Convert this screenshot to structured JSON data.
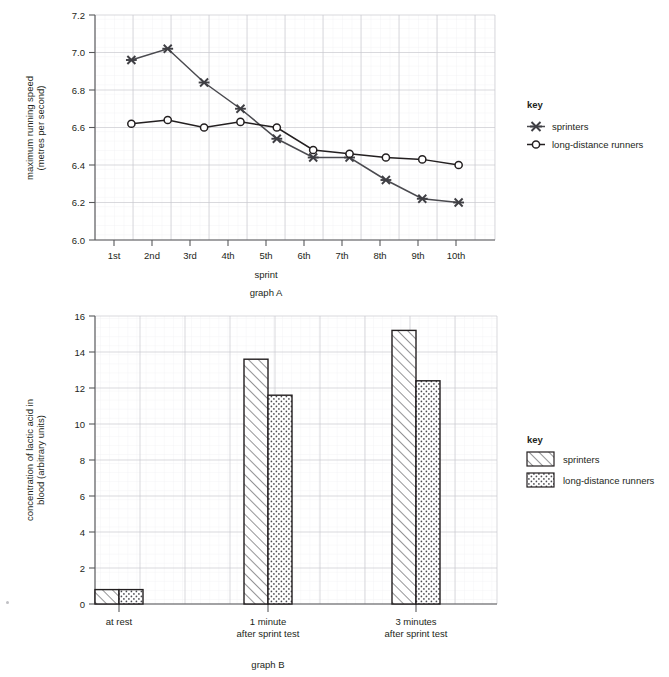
{
  "chart_data": [
    {
      "id": "graphA",
      "type": "line",
      "caption": "graph A",
      "title": "",
      "xlabel": "sprint",
      "ylabel": "maximum running speed\n(metres per second)",
      "ylabel_line1": "maximum running speed",
      "ylabel_line2": "(metres per second)",
      "categories": [
        "1st",
        "2nd",
        "3rd",
        "4th",
        "5th",
        "6th",
        "7th",
        "8th",
        "9th",
        "10th"
      ],
      "ylim": [
        6.0,
        7.2
      ],
      "yticks": [
        "7.2",
        "7.0",
        "6.8",
        "6.6",
        "6.4",
        "6.2",
        "6.0"
      ],
      "ytick_values": [
        7.2,
        7.0,
        6.8,
        6.6,
        6.4,
        6.2,
        6.0
      ],
      "grid": "major-and-minor",
      "legend_position": "right",
      "series": [
        {
          "name": "sprinters",
          "marker": "x-cross",
          "values": [
            6.96,
            7.02,
            6.84,
            6.7,
            6.54,
            6.44,
            6.44,
            6.32,
            6.22,
            6.2
          ]
        },
        {
          "name": "long-distance runners",
          "marker": "open-circle",
          "values": [
            6.62,
            6.64,
            6.6,
            6.63,
            6.6,
            6.48,
            6.46,
            6.44,
            6.43,
            6.4
          ]
        }
      ],
      "key": {
        "title": "key",
        "entries": [
          {
            "label": "sprinters",
            "marker": "x-cross"
          },
          {
            "label": "long-distance runners",
            "marker": "open-circle"
          }
        ]
      }
    },
    {
      "id": "graphB",
      "type": "bar",
      "caption": "graph B",
      "title": "",
      "xlabel": "",
      "ylabel": "concentration of lactic acid in\nblood (arbitrary units)",
      "ylabel_line1": "concentration of lactic acid in",
      "ylabel_line2": "blood (arbitrary units)",
      "categories": [
        "at rest",
        "1 minute\nafter sprint test",
        "3 minutes\nafter sprint test"
      ],
      "category_lines": [
        [
          "at rest"
        ],
        [
          "1 minute",
          "after sprint test"
        ],
        [
          "3 minutes",
          "after sprint test"
        ]
      ],
      "ylim": [
        0,
        16
      ],
      "yticks": [
        "16",
        "14",
        "12",
        "10",
        "8",
        "6",
        "4",
        "2",
        "0"
      ],
      "ytick_values": [
        16,
        14,
        12,
        10,
        8,
        6,
        4,
        2,
        0
      ],
      "grid": "major-and-minor",
      "legend_position": "right",
      "series": [
        {
          "name": "sprinters",
          "fill": "diagonal-hatch",
          "values": [
            0.8,
            13.6,
            15.2
          ]
        },
        {
          "name": "long-distance runners",
          "fill": "dotted",
          "values": [
            0.8,
            11.6,
            12.4
          ]
        }
      ],
      "key": {
        "title": "key",
        "entries": [
          {
            "label": "sprinters",
            "fill": "diagonal-hatch"
          },
          {
            "label": "long-distance runners",
            "fill": "dotted"
          }
        ]
      }
    }
  ],
  "colors": {
    "ink": "#231f20",
    "axis": "#58595b",
    "grid_major": "#c9c9cf",
    "grid_minor": "#e6e6ec",
    "background": "#ffffff"
  }
}
